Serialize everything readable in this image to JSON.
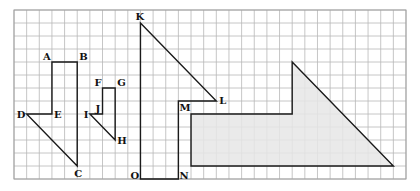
{
  "grid": {
    "origin_px": [
      14,
      10
    ],
    "cell_w": 12.645,
    "cell_h": 13.0,
    "cols": 31,
    "rows": 13,
    "line_color": "#b8b8b8"
  },
  "figures": [
    {
      "id": "figure-abcde",
      "name": "polygon ABCDE",
      "shaded": false,
      "points": [
        {
          "label": "A",
          "col": 3,
          "row": 4,
          "dx": -9,
          "dy": -2
        },
        {
          "label": "B",
          "col": 5,
          "row": 4,
          "dx": 2,
          "dy": -2
        },
        {
          "label": "C",
          "col": 5,
          "row": 12,
          "dx": -3,
          "dy": 11
        },
        {
          "label": "D",
          "col": 1,
          "row": 8,
          "dx": -10,
          "dy": 4
        },
        {
          "label": "E",
          "col": 3,
          "row": 8,
          "dx": 2,
          "dy": 4
        }
      ],
      "path": [
        "A",
        "B",
        "C",
        "D",
        "E",
        "A"
      ]
    },
    {
      "id": "figure-fghij",
      "name": "polygon FGHIJ",
      "shaded": false,
      "points": [
        {
          "label": "F",
          "col": 7,
          "row": 6,
          "dx": -8,
          "dy": -2
        },
        {
          "label": "G",
          "col": 8,
          "row": 6,
          "dx": 2,
          "dy": -2
        },
        {
          "label": "H",
          "col": 8,
          "row": 10,
          "dx": 2,
          "dy": 4
        },
        {
          "label": "I",
          "col": 6,
          "row": 8,
          "dx": -6,
          "dy": 4
        },
        {
          "label": "J",
          "col": 7,
          "row": 8,
          "dx": -7,
          "dy": -2
        }
      ],
      "path": [
        "F",
        "G",
        "H",
        "I",
        "J",
        "F"
      ]
    },
    {
      "id": "figure-klmno",
      "name": "polygon KLMNO",
      "shaded": false,
      "points": [
        {
          "label": "K",
          "col": 10,
          "row": 1,
          "dx": -5,
          "dy": -3
        },
        {
          "label": "L",
          "col": 16,
          "row": 7,
          "dx": 3,
          "dy": 3
        },
        {
          "label": "M",
          "col": 13,
          "row": 7,
          "dx": 1,
          "dy": 10
        },
        {
          "label": "N",
          "col": 13,
          "row": 13,
          "dx": 1,
          "dy": 0
        },
        {
          "label": "O",
          "col": 10,
          "row": 13,
          "dx": -10,
          "dy": 0
        }
      ],
      "path": [
        "K",
        "L",
        "M",
        "N",
        "O",
        "K"
      ]
    },
    {
      "id": "figure-shaded",
      "name": "shaded polygon",
      "shaded": true,
      "fill": "#e6e6e6",
      "points": [
        {
          "label": "",
          "col": 14,
          "row": 8
        },
        {
          "label": "",
          "col": 22,
          "row": 8
        },
        {
          "label": "",
          "col": 22,
          "row": 4
        },
        {
          "label": "",
          "col": 30,
          "row": 12
        },
        {
          "label": "",
          "col": 14,
          "row": 12
        }
      ],
      "path": [
        0,
        1,
        2,
        3,
        4,
        0
      ]
    }
  ]
}
